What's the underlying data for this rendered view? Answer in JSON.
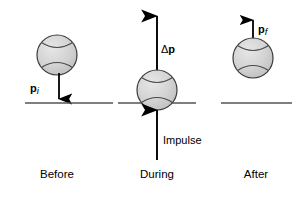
{
  "figure": {
    "background_color": "#ffffff",
    "ink_color": "#000000",
    "ball_fill_color": "#d2d2d2",
    "ball_stroke_color": "#3a3a3a",
    "ground_color": "#555555"
  },
  "panels": [
    {
      "id": "before",
      "caption": "Before",
      "ball": {
        "cx": 57,
        "cy": 55,
        "r": 20
      },
      "ground": {
        "x1": 25,
        "x2": 113,
        "y": 103
      },
      "arrow": {
        "name": "momentum-initial-arrow",
        "direction": "down",
        "x": 59,
        "y_start": 73,
        "y_end": 102
      },
      "label": {
        "symbol": "p",
        "subscript": "i",
        "text": "pi",
        "x": 30,
        "y": 92
      }
    },
    {
      "id": "during",
      "caption": "During",
      "ball": {
        "cx": 157,
        "cy": 90,
        "r": 20
      },
      "ground": {
        "x1": 118,
        "x2": 196,
        "y": 103
      },
      "arrow_up": {
        "name": "delta-p-arrow",
        "direction": "up",
        "x": 157,
        "y_start": 71,
        "y_end": 12
      },
      "arrow_impulse": {
        "name": "impulse-arrow",
        "direction": "up",
        "x": 157,
        "y_start": 160,
        "y_end": 107
      },
      "label_delta": {
        "symbol": "Δp",
        "text": "Δp",
        "x": 162,
        "y": 52
      },
      "label_impulse": {
        "text": "Impulse",
        "x": 163,
        "y": 143
      }
    },
    {
      "id": "after",
      "caption": "After",
      "ball": {
        "cx": 253,
        "cy": 58,
        "r": 20
      },
      "ground": {
        "x1": 221,
        "x2": 292,
        "y": 103
      },
      "arrow": {
        "name": "momentum-final-arrow",
        "direction": "up",
        "x": 253,
        "y_start": 45,
        "y_end": 16
      },
      "label": {
        "symbol": "p",
        "subscript": "f",
        "text": "pf",
        "x": 258,
        "y": 32
      }
    }
  ],
  "captions": {
    "before": "Before",
    "during": "During",
    "after": "After",
    "y": 178,
    "before_x": 57,
    "during_x": 157,
    "after_x": 256
  },
  "labels": {
    "p_initial_symbol": "p",
    "p_initial_sub": "i",
    "delta_p": "Δp",
    "impulse": "Impulse",
    "p_final_symbol": "p",
    "p_final_sub": "f"
  }
}
